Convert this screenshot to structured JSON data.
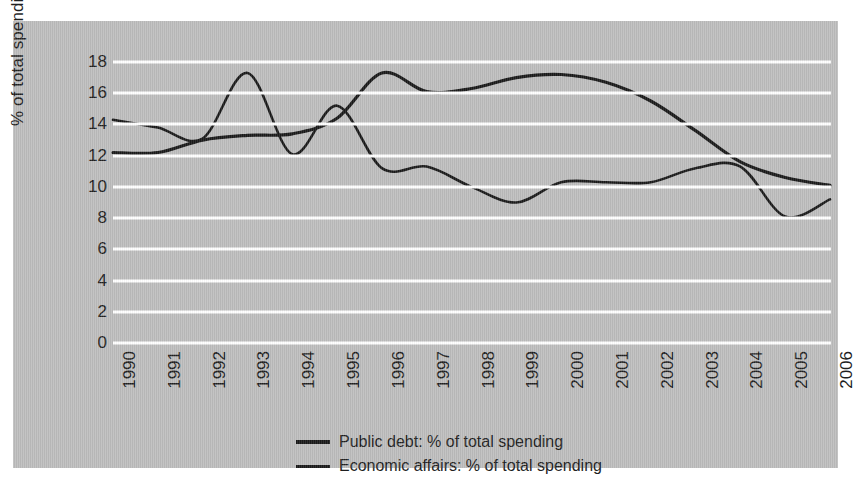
{
  "chart_data": {
    "type": "line",
    "title": "",
    "xlabel": "",
    "ylabel": "% of total spending",
    "ylim": [
      0,
      18
    ],
    "ytick_step": 2,
    "yticks": [
      18,
      16,
      14,
      12,
      10,
      8,
      6,
      4,
      2,
      0
    ],
    "grid": true,
    "legend_position": "bottom",
    "x": [
      1990,
      1991,
      1992,
      1993,
      1994,
      1995,
      1996,
      1997,
      1998,
      1999,
      2000,
      2001,
      2002,
      2003,
      2004,
      2005,
      2006
    ],
    "categories": [
      "1990",
      "1991",
      "1992",
      "1993",
      "1994",
      "1995",
      "1996",
      "1997",
      "1998",
      "1999",
      "2000",
      "2001",
      "2002",
      "2003",
      "2004",
      "2005",
      "2006"
    ],
    "series": [
      {
        "name": "Public debt: % of total spending",
        "color": "#1a1a1a",
        "stroke_width": 3.2,
        "values": [
          12.2,
          12.2,
          13.0,
          13.3,
          13.4,
          14.4,
          17.3,
          16.1,
          16.3,
          17.0,
          17.2,
          16.7,
          15.5,
          13.6,
          11.6,
          10.6,
          10.1
        ]
      },
      {
        "name": "Economic affairs: % of total spending",
        "color": "#1a1a1a",
        "stroke_width": 2.6,
        "values": [
          14.3,
          13.8,
          13.1,
          17.3,
          12.1,
          15.2,
          11.2,
          11.3,
          10.0,
          9.0,
          10.3,
          10.3,
          10.3,
          11.2,
          11.3,
          8.1,
          9.2
        ]
      }
    ],
    "annotations": []
  },
  "legend": {
    "items": [
      {
        "label": "Public debt: % of total spending",
        "swatch_height": 4
      },
      {
        "label": "Economic affairs: % of total spending",
        "swatch_height": 3
      }
    ]
  },
  "colors": {
    "panel_background": "#bdbdbd",
    "gridline": "#ffffff",
    "line": "#1a1a1a",
    "text": "#1f1f1f",
    "page_background": "#ffffff"
  }
}
